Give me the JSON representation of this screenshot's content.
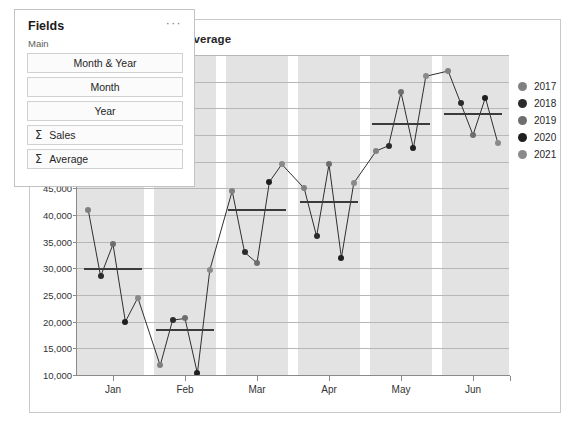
{
  "fields_panel": {
    "title": "Fields",
    "more_menu": "···",
    "subheading": "Main",
    "items": [
      {
        "label": "Month & Year",
        "icon": "",
        "aggregate": false
      },
      {
        "label": "Month",
        "icon": "",
        "aggregate": false
      },
      {
        "label": "Year",
        "icon": "",
        "aggregate": false
      },
      {
        "label": "Sales",
        "icon": "Σ",
        "aggregate": true
      },
      {
        "label": "Average",
        "icon": "Σ",
        "aggregate": true
      }
    ]
  },
  "chart_data": {
    "type": "line",
    "title": "Month, Year, Sales and Average",
    "xlabel": "",
    "ylabel": "",
    "grid": true,
    "legend_position": "right",
    "categories": [
      "Jan",
      "Feb",
      "Mar",
      "Apr",
      "May",
      "Jun"
    ],
    "legend": [
      "2017",
      "2018",
      "2019",
      "2020",
      "2021"
    ],
    "legend_colors": [
      "#808080",
      "#2b2b2b",
      "#6e6e6e",
      "#1f1f1f",
      "#8a8a8a"
    ],
    "ytick_labels": [
      "50,000",
      "45,000",
      "40,000",
      "35,000",
      "30,000",
      "25,000",
      "20,000",
      "15,000",
      "10,000"
    ],
    "ytick_values": [
      50000,
      45000,
      40000,
      35000,
      30000,
      25000,
      20000,
      15000,
      10000
    ],
    "ylim": [
      10000,
      70000
    ],
    "gridline_step": 5000,
    "series_name": "Sales",
    "average_name": "Average",
    "groups": [
      {
        "category": "Jan",
        "sales": [
          41000,
          28500,
          34500,
          20000,
          24500
        ],
        "average": 29800
      },
      {
        "category": "Feb",
        "sales": [
          11800,
          20300,
          20600,
          10300,
          29700
        ],
        "average": 18400
      },
      {
        "category": "Mar",
        "sales": [
          44500,
          33000,
          31000,
          46200,
          49500
        ],
        "average": 41000
      },
      {
        "category": "Apr",
        "sales": [
          45000,
          36000,
          49500,
          32000,
          46000
        ],
        "average": 42500
      },
      {
        "category": "May",
        "sales": [
          52000,
          53000,
          63000,
          52500,
          66000
        ],
        "average": 57000
      },
      {
        "category": "Jun",
        "sales": [
          67000,
          61000,
          55000,
          62000,
          53500
        ],
        "average": 59000
      }
    ]
  },
  "colors": {
    "plot_background": "#e3e3e3",
    "gridline": "#b7b7b7",
    "marker": "#2f2f2f",
    "average_line": "#3b3b3b",
    "axis": "#8a8a8a",
    "border": "#c9c9c9"
  }
}
